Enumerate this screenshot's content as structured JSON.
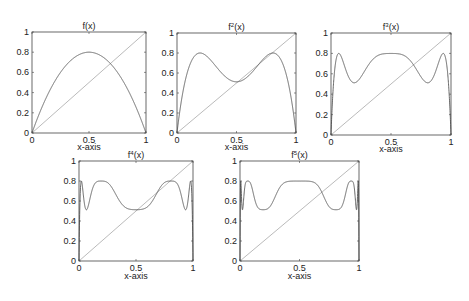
{
  "chart_data": [
    {
      "type": "line",
      "title": "f(x)",
      "xlabel": "x-axis",
      "ylabel": "",
      "xlim": [
        0,
        1
      ],
      "ylim": [
        0,
        1
      ],
      "xticks": [
        "0",
        "0.5",
        "1"
      ],
      "yticks": [
        "0",
        "0.2",
        "0.4",
        "0.6",
        "0.8",
        "1"
      ],
      "grid": false,
      "iterate": 1,
      "series": [
        {
          "name": "f(x) = 3.2x(1-x)",
          "x": [
            0,
            0.1,
            0.2,
            0.3,
            0.4,
            0.5,
            0.6,
            0.7,
            0.8,
            0.9,
            1
          ],
          "values": [
            0,
            0.288,
            0.512,
            0.672,
            0.768,
            0.8,
            0.768,
            0.672,
            0.512,
            0.288,
            0
          ]
        },
        {
          "name": "y = x",
          "x": [
            0,
            1
          ],
          "values": [
            0,
            1
          ]
        }
      ]
    },
    {
      "type": "line",
      "title": "f2(x)",
      "title_base": "f",
      "title_sup": "2",
      "title_arg": "(x)",
      "xlabel": "x-axis",
      "xlim": [
        0,
        1
      ],
      "ylim": [
        0,
        1
      ],
      "xticks": [
        "0",
        "0.5",
        "1"
      ],
      "yticks": [
        "0",
        "0.2",
        "0.4",
        "0.6",
        "0.8",
        "1"
      ],
      "grid": false,
      "iterate": 2,
      "series": [
        {
          "name": "f^2(x)",
          "x": [
            0,
            0.1,
            0.2,
            0.3,
            0.4,
            0.5,
            0.6,
            0.7,
            0.8,
            0.9,
            1
          ],
          "values": [
            0,
            0.656,
            0.8,
            0.704,
            0.57,
            0.512,
            0.57,
            0.704,
            0.8,
            0.656,
            0
          ]
        },
        {
          "name": "y = x",
          "x": [
            0,
            1
          ],
          "values": [
            0,
            1
          ]
        }
      ]
    },
    {
      "type": "line",
      "title": "f3(x)",
      "title_base": "f",
      "title_sup": "3",
      "title_arg": "(x)",
      "xlabel": "x-axis",
      "xlim": [
        0,
        1
      ],
      "ylim": [
        0,
        1
      ],
      "xticks": [
        "0",
        "0.5",
        "1"
      ],
      "yticks": [
        "0",
        "0.2",
        "0.4",
        "0.6",
        "0.8",
        "1"
      ],
      "grid": false,
      "iterate": 3,
      "series": [
        {
          "name": "f^3(x)",
          "x": [
            0,
            0.07,
            0.2,
            0.5,
            0.8,
            0.93,
            1
          ],
          "values": [
            0,
            0.8,
            0.512,
            0.8,
            0.512,
            0.8,
            0
          ]
        },
        {
          "name": "y = x",
          "x": [
            0,
            1
          ],
          "values": [
            0,
            1
          ]
        }
      ]
    },
    {
      "type": "line",
      "title": "f4(x)",
      "title_base": "f",
      "title_sup": "4",
      "title_arg": "(x)",
      "xlabel": "x-axis",
      "xlim": [
        0,
        1
      ],
      "ylim": [
        0,
        1
      ],
      "xticks": [
        "0",
        "0.5",
        "1"
      ],
      "yticks": [
        "0",
        "0.2",
        "0.4",
        "0.6",
        "0.8",
        "1"
      ],
      "grid": false,
      "iterate": 4,
      "series": [
        {
          "name": "f^4(x)",
          "x": [
            0,
            0.02,
            0.07,
            0.2,
            0.5,
            0.8,
            0.93,
            0.98,
            1
          ],
          "values": [
            0,
            0.8,
            0.512,
            0.8,
            0.512,
            0.8,
            0.512,
            0.8,
            0
          ]
        },
        {
          "name": "y = x",
          "x": [
            0,
            1
          ],
          "values": [
            0,
            1
          ]
        }
      ]
    },
    {
      "type": "line",
      "title": "f5(x)",
      "title_base": "f",
      "title_sup": "5",
      "title_arg": "(x)",
      "xlabel": "x-axis",
      "xlim": [
        0,
        1
      ],
      "ylim": [
        0,
        1
      ],
      "xticks": [
        "0",
        "0.5",
        "1"
      ],
      "yticks": [
        "0",
        "0.2",
        "0.4",
        "0.6",
        "0.8",
        "1"
      ],
      "grid": false,
      "iterate": 5,
      "series": [
        {
          "name": "f^5(x)",
          "x": [
            0,
            0.07,
            0.2,
            0.5,
            0.8,
            0.93,
            1
          ],
          "values": [
            0,
            0.8,
            0.512,
            0.8,
            0.512,
            0.8,
            0
          ]
        },
        {
          "name": "y = x",
          "x": [
            0,
            1
          ],
          "values": [
            0,
            1
          ]
        }
      ]
    }
  ],
  "params": {
    "r": 3.2
  },
  "colors": {
    "curve": "#555555",
    "diagonal": "#a8a8a8",
    "axes": "#444444",
    "text": "#222222"
  }
}
